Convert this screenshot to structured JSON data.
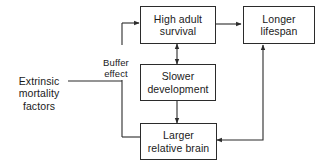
{
  "diagram": {
    "background_color": "#ffffff",
    "stroke_color": "#2b2b2b",
    "text_color": "#1a1a1a",
    "nodes": [
      {
        "id": "high-adult-survival",
        "label": "High adult\nsurvival",
        "boxed": true
      },
      {
        "id": "longer-lifespan",
        "label": "Longer\nlifespan",
        "boxed": true
      },
      {
        "id": "slower-development",
        "label": "Slower\ndevelopment",
        "boxed": true
      },
      {
        "id": "larger-relative-brain",
        "label": "Larger\nrelative brain",
        "boxed": true
      },
      {
        "id": "extrinsic-mortality-factors",
        "label": "Extrinsic\nmortality\nfactors",
        "boxed": false
      }
    ],
    "edge_labels": [
      {
        "id": "buffer-effect",
        "label": "Buffer\neffect"
      }
    ],
    "edges": [
      {
        "id": "high-adult-survival-to-longer-lifespan",
        "from": "high-adult-survival",
        "to": "longer-lifespan",
        "arrowheads": "single"
      },
      {
        "id": "high-adult-survival-slower-development",
        "from": "high-adult-survival",
        "to": "slower-development",
        "arrowheads": "double"
      },
      {
        "id": "slower-development-to-larger-relative-brain",
        "from": "slower-development",
        "to": "larger-relative-brain",
        "arrowheads": "single"
      },
      {
        "id": "larger-relative-brain-to-longer-lifespan",
        "from": "larger-relative-brain",
        "to": "longer-lifespan",
        "arrowheads": "single"
      },
      {
        "id": "extrinsic-mortality-factors-trunk",
        "from": "extrinsic-mortality-factors",
        "to": "buffer-trunk",
        "arrowheads": "none"
      },
      {
        "id": "buffer-trunk-to-high-adult-survival",
        "from": "buffer-trunk",
        "to": "high-adult-survival",
        "arrowheads": "single"
      },
      {
        "id": "buffer-trunk-to-larger-relative-brain",
        "from": "buffer-trunk",
        "to": "larger-relative-brain",
        "arrowheads": "none"
      }
    ]
  }
}
